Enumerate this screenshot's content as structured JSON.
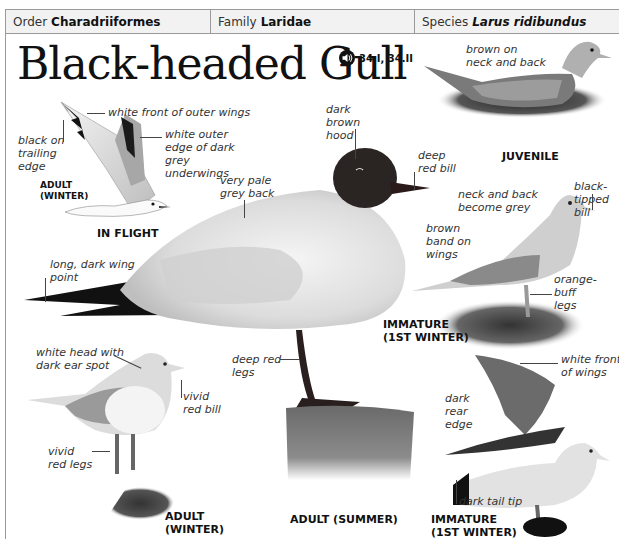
{
  "header": {
    "order_label": "Order",
    "order_value": "Charadriiformes",
    "family_label": "Family",
    "family_value": "Laridae",
    "species_label": "Species",
    "species_value": "Larus ridibundus"
  },
  "title": "Black-headed Gull",
  "audio": {
    "icon": "speaker-icon",
    "tracks": "34.I, 34.II"
  },
  "figures": {
    "in_flight": {
      "caption": "IN FLIGHT",
      "subcaption": "ADULT\n(WINTER)",
      "labels": [
        "white front of outer wings",
        "black on trailing edge",
        "white outer edge of dark grey underwings"
      ]
    },
    "adult_summer": {
      "caption": "ADULT (SUMMER)",
      "labels": [
        "dark brown hood",
        "deep red bill",
        "very pale grey back",
        "long, dark wing point",
        "deep red legs"
      ]
    },
    "juvenile": {
      "caption": "JUVENILE",
      "labels": [
        "brown on neck and back"
      ]
    },
    "immature_standing": {
      "caption": "IMMATURE\n(1ST WINTER)",
      "labels": [
        "black-tipped bill",
        "neck and back become grey",
        "brown band on wings",
        "orange-buff legs"
      ]
    },
    "adult_winter": {
      "caption": "ADULT\n(WINTER)",
      "labels": [
        "white head with dark ear spot",
        "vivid red bill",
        "vivid red legs"
      ]
    },
    "immature_flapping": {
      "caption": "IMMATURE\n(1ST WINTER)",
      "labels": [
        "white front of wings",
        "dark rear edge",
        "dark tail tip"
      ]
    }
  }
}
